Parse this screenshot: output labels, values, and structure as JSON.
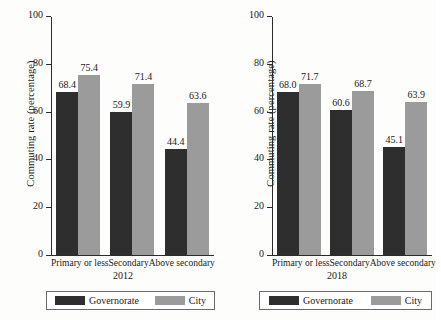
{
  "figure": {
    "background": "#fdfdfc",
    "series_colors": {
      "governorate": "#2e2e2e",
      "city": "#9b9b9b"
    }
  },
  "chart_data": [
    {
      "type": "bar",
      "title": "",
      "panel_label": "2012",
      "xlabel": "2012",
      "ylabel": "Commuting rate (percentage)",
      "categories": [
        "Primary or less",
        "Secondary",
        "Above secondary"
      ],
      "series": [
        {
          "name": "Governorate",
          "color": "#2e2e2e",
          "values": [
            68.4,
            59.9,
            44.4
          ]
        },
        {
          "name": "City",
          "color": "#9b9b9b",
          "values": [
            75.4,
            71.4,
            63.6
          ]
        }
      ],
      "ylim": [
        0,
        100
      ],
      "yticks": [
        0,
        20,
        40,
        60,
        80,
        100
      ],
      "ytick_labels": [
        "0",
        "20",
        "40",
        "60",
        "80",
        "100"
      ],
      "grid": false,
      "legend_position": "bottom",
      "data_labels": true
    },
    {
      "type": "bar",
      "title": "",
      "panel_label": "2018",
      "xlabel": "2018",
      "ylabel": "Commuting rate (percentage)",
      "categories": [
        "Primary or less",
        "Secondary",
        "Above secondary"
      ],
      "series": [
        {
          "name": "Governorate",
          "color": "#2e2e2e",
          "values": [
            68.0,
            60.6,
            45.1
          ]
        },
        {
          "name": "City",
          "color": "#9b9b9b",
          "values": [
            71.7,
            68.7,
            63.9
          ]
        }
      ],
      "ylim": [
        0,
        100
      ],
      "yticks": [
        0,
        20,
        40,
        60,
        80,
        100
      ],
      "ytick_labels": [
        "0",
        "20",
        "40",
        "60",
        "80",
        "100"
      ],
      "grid": false,
      "legend_position": "bottom",
      "data_labels": true
    }
  ]
}
